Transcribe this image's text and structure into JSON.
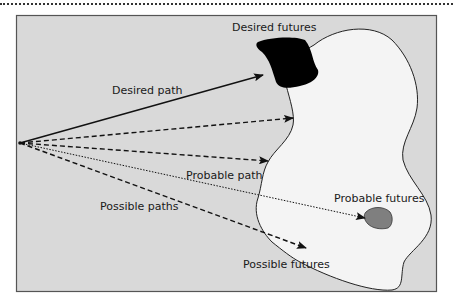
{
  "diagram": {
    "type": "futures-cone",
    "colors": {
      "frame_fill": "#d9d9d9",
      "frame_stroke": "#555555",
      "possible_region_fill": "#f4f4f4",
      "desired_fill": "#000000",
      "probable_fill": "#808080",
      "line": "#111111"
    },
    "labels": {
      "desired_futures": "Desired futures",
      "desired_path": "Desired path",
      "probable_path": "Probable path",
      "probable_futures": "Probable futures",
      "possible_paths": "Possible paths",
      "possible_futures": "Possible futures"
    },
    "paths": [
      {
        "name": "desired-path",
        "style": "solid"
      },
      {
        "name": "possible-path-1",
        "style": "dashed"
      },
      {
        "name": "possible-path-2",
        "style": "dashed"
      },
      {
        "name": "probable-path",
        "style": "dotted"
      },
      {
        "name": "possible-path-3",
        "style": "dashed"
      }
    ]
  }
}
